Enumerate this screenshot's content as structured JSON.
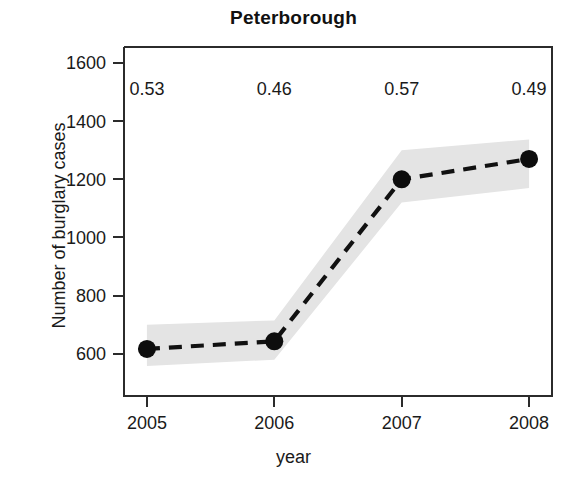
{
  "chart_data": {
    "type": "line",
    "title": "Peterborough",
    "xlabel": "year",
    "ylabel": "Number of burglary cases",
    "x": [
      2005,
      2006,
      2007,
      2008
    ],
    "xtick_labels": [
      "2005",
      "2006",
      "2007",
      "2008"
    ],
    "values": [
      617,
      643,
      1200,
      1270
    ],
    "ytick_labels": [
      "1600",
      "1400",
      "1200",
      "1000",
      "800",
      "600"
    ],
    "yticks": [
      1600,
      1400,
      1200,
      1000,
      800,
      600
    ],
    "ylim": [
      455,
      1655
    ],
    "xlim": [
      2004.82,
      2008.18
    ],
    "grid": false,
    "legend": false,
    "series": [
      {
        "name": "Number of burglary cases",
        "values": [
          617,
          643,
          1200,
          1270
        ],
        "line_style": "dashed",
        "marker": "filled-circle",
        "color": "#111111"
      }
    ],
    "confidence_band": {
      "label": "confidence interval",
      "fill_color": "#e4e4e4",
      "lower": [
        558,
        580,
        1120,
        1170
      ],
      "upper": [
        700,
        715,
        1300,
        1337
      ]
    },
    "annotations": [
      {
        "x": 2005,
        "value": "0.53",
        "y": 1490
      },
      {
        "x": 2006,
        "value": "0.46",
        "y": 1490
      },
      {
        "x": 2007,
        "value": "0.57",
        "y": 1490
      },
      {
        "x": 2008,
        "value": "0.49",
        "y": 1490
      }
    ],
    "annotation_values": [
      "0.53",
      "0.46",
      "0.57",
      "0.49"
    ]
  }
}
